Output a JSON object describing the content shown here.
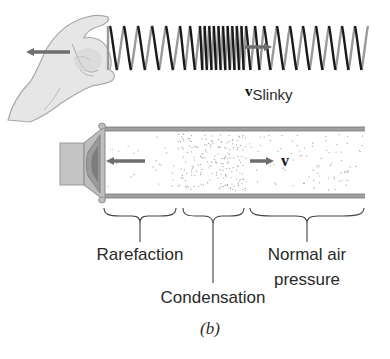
{
  "figure": {
    "caption": "(b)",
    "top_panel": {
      "subject": "Slinky pulled by hand",
      "velocity_label_main": "v",
      "velocity_label_sub": "Slinky",
      "icons": [
        "hand-icon",
        "slinky-spring",
        "left-arrow-icon",
        "right-arrow-icon"
      ]
    },
    "bottom_panel": {
      "subject": "Sound wave in air-filled tube driven by speaker",
      "velocity_label": "v",
      "regions": [
        {
          "label": "Rarefaction",
          "x_start": 103,
          "x_end": 178
        },
        {
          "label": "Condensation",
          "x_start": 182,
          "x_end": 245
        },
        {
          "label_line1": "Normal air",
          "label_line2": "pressure",
          "x_start": 250,
          "x_end": 365
        }
      ],
      "icons": [
        "speaker-icon",
        "tube",
        "left-arrow-icon",
        "right-arrow-icon"
      ]
    },
    "colors": {
      "spring_dark": "#1a1a1a",
      "spring_light": "#9a9a9a",
      "arrow": "#6e6e6e",
      "hand_fill": "#e6e6e6",
      "hand_stroke": "#a8a8a8",
      "tube_wall": "#8a8a8a",
      "speaker_fill": "#bdbdbd",
      "dots": "#9c9c9c",
      "text": "#2a2a2a"
    }
  }
}
